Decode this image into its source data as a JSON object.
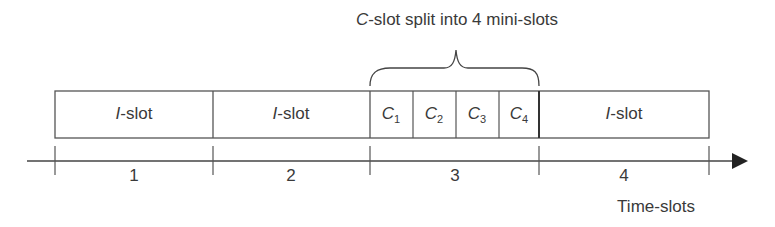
{
  "diagram": {
    "title_prefix": "C",
    "title_rest": "-slot split into 4 mini-slots",
    "slots": [
      {
        "prefix": "I",
        "rest": "-slot",
        "number": "1"
      },
      {
        "prefix": "I",
        "rest": "-slot",
        "number": "2"
      },
      {
        "type": "C",
        "number": "3",
        "minislots": [
          {
            "letter": "C",
            "sub": "1"
          },
          {
            "letter": "C",
            "sub": "2"
          },
          {
            "letter": "C",
            "sub": "3"
          },
          {
            "letter": "C",
            "sub": "4"
          }
        ]
      },
      {
        "prefix": "I",
        "rest": "-slot",
        "number": "4"
      }
    ],
    "axis_label": "Time-slots"
  }
}
